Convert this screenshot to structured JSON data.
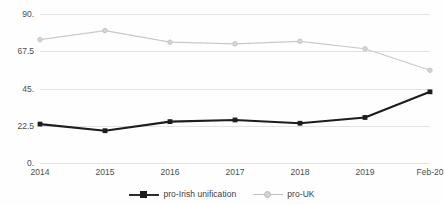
{
  "chart_data": {
    "type": "line",
    "title": "",
    "xlabel": "",
    "ylabel": "",
    "categories": [
      "2014",
      "2015",
      "2016",
      "2017",
      "2018",
      "2019",
      "Feb-20"
    ],
    "ylim": [
      0,
      90
    ],
    "yticks": [
      0,
      22.5,
      45,
      67.5,
      90
    ],
    "ytick_labels": [
      "0.",
      "22.5",
      "45.",
      "67.5",
      "90."
    ],
    "grid": true,
    "legend_position": "bottom",
    "series": [
      {
        "name": "pro-Irish unification",
        "color": "#1d1d1d",
        "marker": "square",
        "values": [
          23.5,
          19.5,
          25,
          26,
          24,
          27.5,
          43
        ]
      },
      {
        "name": "pro-UK",
        "color": "#c9c9c9",
        "marker": "circle",
        "values": [
          74.5,
          80,
          73,
          72,
          73.5,
          69,
          56
        ]
      }
    ]
  },
  "legend": {
    "entries": [
      {
        "label": "pro-Irish unification"
      },
      {
        "label": "pro-UK"
      }
    ]
  },
  "colors": {
    "series_dark": "#1d1d1d",
    "series_light": "#c9c9c9",
    "gridline": "#e3e3e3",
    "text": "#4d4d4d",
    "background": "#fefefe"
  }
}
